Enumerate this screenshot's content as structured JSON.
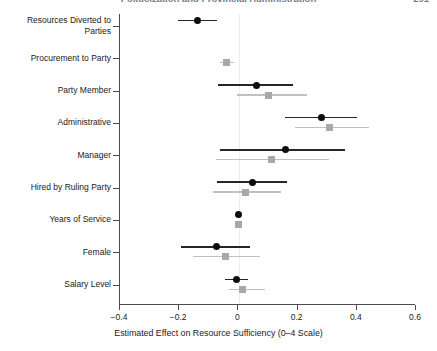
{
  "running_head": {
    "title": "Politicization and Provincial Administration",
    "page_number": "291"
  },
  "chart_data": {
    "type": "scatter",
    "subtype": "coefficient-plot",
    "title": "",
    "xlabel": "Estimated Effect on Resource Sufficiency (0–4 Scale)",
    "ylabel": "",
    "xlim": [
      -0.4,
      0.6
    ],
    "xticks": [
      -0.4,
      -0.2,
      0,
      0.2,
      0.4,
      0.6
    ],
    "xticklabels": [
      "−0.4",
      "−0.2",
      "0",
      "0.2",
      "0.4",
      "0.6"
    ],
    "grid": false,
    "legend": null,
    "zero_reference_line": 0,
    "categories": [
      "Resources Diverted to\nParties",
      "Procurement to Party",
      "Party Member",
      "Administrative",
      "Manager",
      "Hired by Ruling Party",
      "Years of Service",
      "Female",
      "Salary Level"
    ],
    "series": [
      {
        "name": "Model 1",
        "marker": "circle",
        "color": "#0d0d0d",
        "points": [
          {
            "category": "Resources Diverted to Parties",
            "estimate": -0.135,
            "ci_low": -0.2,
            "ci_high": -0.07
          },
          {
            "category": "Procurement to Party",
            "estimate": null,
            "ci_low": null,
            "ci_high": null
          },
          {
            "category": "Party Member",
            "estimate": 0.065,
            "ci_low": -0.064,
            "ci_high": 0.187
          },
          {
            "category": "Administrative",
            "estimate": 0.283,
            "ci_low": 0.162,
            "ci_high": 0.403
          },
          {
            "category": "Manager",
            "estimate": 0.164,
            "ci_low": -0.058,
            "ci_high": 0.362
          },
          {
            "category": "Hired by Ruling Party",
            "estimate": 0.051,
            "ci_low": -0.068,
            "ci_high": 0.166
          },
          {
            "category": "Years of Service",
            "estimate": 0.004,
            "ci_low": -0.004,
            "ci_high": 0.012
          },
          {
            "category": "Female",
            "estimate": -0.072,
            "ci_low": -0.19,
            "ci_high": 0.044
          },
          {
            "category": "Salary Level",
            "estimate": -0.002,
            "ci_low": -0.042,
            "ci_high": 0.037
          }
        ]
      },
      {
        "name": "Model 2",
        "marker": "square",
        "color": "#a8a8a8",
        "points": [
          {
            "category": "Resources Diverted to Parties",
            "estimate": null,
            "ci_low": null,
            "ci_high": null
          },
          {
            "category": "Procurement to Party",
            "estimate": -0.037,
            "ci_low": -0.058,
            "ci_high": -0.01
          },
          {
            "category": "Party Member",
            "estimate": 0.105,
            "ci_low": 0.0,
            "ci_high": 0.234
          },
          {
            "category": "Administrative",
            "estimate": 0.312,
            "ci_low": 0.195,
            "ci_high": 0.444
          },
          {
            "category": "Manager",
            "estimate": 0.115,
            "ci_low": -0.071,
            "ci_high": 0.308
          },
          {
            "category": "Hired by Ruling Party",
            "estimate": 0.027,
            "ci_low": -0.081,
            "ci_high": 0.146
          },
          {
            "category": "Years of Service",
            "estimate": 0.003,
            "ci_low": -0.004,
            "ci_high": 0.011
          },
          {
            "category": "Female",
            "estimate": -0.041,
            "ci_low": -0.149,
            "ci_high": 0.078
          },
          {
            "category": "Salary Level",
            "estimate": 0.017,
            "ci_low": -0.028,
            "ci_high": 0.092
          }
        ]
      }
    ]
  }
}
